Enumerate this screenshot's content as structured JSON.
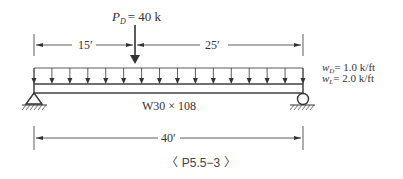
{
  "diagram": {
    "point_load": {
      "symbol": "P",
      "subscript": "D",
      "value_text": "= 40 k"
    },
    "dimensions": {
      "left_span": "15′",
      "right_span": "25′",
      "total_span": "40′"
    },
    "distributed_loads": [
      {
        "symbol": "w",
        "subscript": "D",
        "value_text": "= 1.0 k/ft"
      },
      {
        "symbol": "w",
        "subscript": "L",
        "value_text": "= 2.0 k/ft"
      }
    ],
    "beam_section": "W30 × 108",
    "supports": {
      "left": "pin",
      "right": "roller"
    },
    "caption": "〈 P5.5−3 〉"
  }
}
